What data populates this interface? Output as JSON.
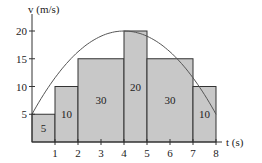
{
  "chart_data": {
    "type": "bar",
    "title": "",
    "xlabel": "t (s)",
    "ylabel": "v (m/s)",
    "xlim": [
      0,
      8
    ],
    "ylim": [
      0,
      20
    ],
    "x_ticks": [
      1,
      2,
      3,
      4,
      5,
      6,
      7,
      8
    ],
    "y_ticks": [
      5,
      10,
      15,
      20
    ],
    "grid": false,
    "rectangles": [
      {
        "x0": 0,
        "x1": 1,
        "height": 5,
        "area_label": "5"
      },
      {
        "x0": 1,
        "x1": 2,
        "height": 10,
        "area_label": "10"
      },
      {
        "x0": 2,
        "x1": 4,
        "height": 15,
        "area_label": "30"
      },
      {
        "x0": 4,
        "x1": 5,
        "height": 20,
        "area_label": "20"
      },
      {
        "x0": 5,
        "x1": 7,
        "height": 15,
        "area_label": "30"
      },
      {
        "x0": 7,
        "x1": 8,
        "height": 10,
        "area_label": "10"
      }
    ],
    "curve": {
      "description": "parabola v(t) passing through (0,5), peak (4,20), (8,5)",
      "points": [
        [
          0,
          5
        ],
        [
          1,
          11.56
        ],
        [
          2,
          16.25
        ],
        [
          3,
          19.06
        ],
        [
          4,
          20
        ],
        [
          5,
          19.06
        ],
        [
          6,
          16.25
        ],
        [
          7,
          11.56
        ],
        [
          8,
          5
        ]
      ]
    },
    "colors": {
      "fill": "#c8c8c8",
      "stroke": "#333333",
      "curve": "#555555"
    }
  },
  "labels": {
    "y_axis": "v (m/s)",
    "x_axis": "t (s)",
    "y_ticks": [
      "5",
      "10",
      "15",
      "20"
    ],
    "x_ticks": [
      "1",
      "2",
      "3",
      "4",
      "5",
      "6",
      "7",
      "8"
    ],
    "areas": [
      "5",
      "10",
      "30",
      "20",
      "30",
      "10"
    ]
  }
}
